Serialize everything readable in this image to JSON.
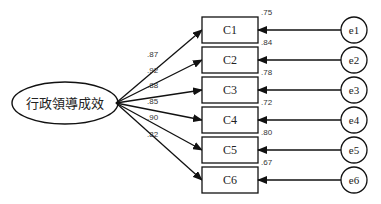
{
  "diagram": {
    "type": "cfa-path-diagram",
    "latent": {
      "label": "行政領導成效",
      "cx": 65,
      "cy": 103,
      "rx": 53,
      "ry": 21
    },
    "indicators": [
      {
        "label": "C1",
        "loading": ".87",
        "residual_label": ".75",
        "error": "e1"
      },
      {
        "label": "C2",
        "loading": ".92",
        "residual_label": ".84",
        "error": "e2"
      },
      {
        "label": "C3",
        "loading": ".88",
        "residual_label": ".78",
        "error": "e3"
      },
      {
        "label": "C4",
        "loading": ".85",
        "residual_label": ".72",
        "error": "e4"
      },
      {
        "label": "C5",
        "loading": ".90",
        "residual_label": ".80",
        "error": "e5"
      },
      {
        "label": "C6",
        "loading": ".82",
        "residual_label": ".67",
        "error": "e6"
      }
    ],
    "colors": {
      "stroke": "#111111",
      "background": "#ffffff"
    }
  }
}
